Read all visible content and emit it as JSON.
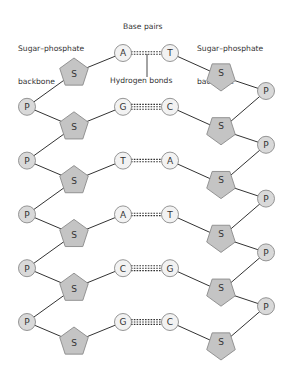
{
  "labels": {
    "left_backbone_line1": "Sugar–phosphate",
    "left_backbone_line2": "backbone",
    "base_pairs": "Base pairs",
    "right_backbone_line1": "Sugar–phosphate",
    "right_backbone_line2": "backbone",
    "hydrogen_bonds": "Hydrogen bonds"
  },
  "symbols": {
    "sugar": "S",
    "phosphate": "P"
  },
  "colors": {
    "sugar_fill": "#c4c4c4",
    "sugar_stroke": "#8a8a8a",
    "phosphate_fill": "#d9d9d9",
    "phosphate_stroke": "#8a8a8a",
    "base_fill": "#f2f2f2",
    "base_stroke": "#8a8a8a",
    "line": "#333333",
    "text": "#333333"
  },
  "base_pairs": [
    {
      "left": "A",
      "right": "T",
      "hbonds": 2
    },
    {
      "left": "G",
      "right": "C",
      "hbonds": 3
    },
    {
      "left": "T",
      "right": "A",
      "hbonds": 2
    },
    {
      "left": "A",
      "right": "T",
      "hbonds": 2
    },
    {
      "left": "C",
      "right": "G",
      "hbonds": 3
    },
    {
      "left": "G",
      "right": "C",
      "hbonds": 3
    }
  ]
}
